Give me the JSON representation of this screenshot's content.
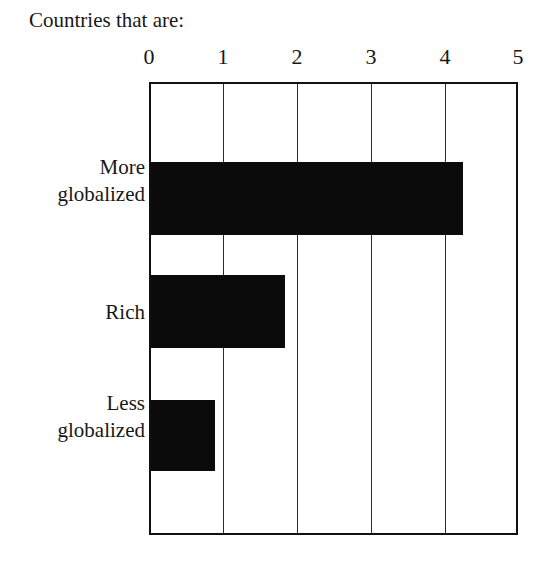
{
  "chart_data": {
    "type": "bar",
    "orientation": "horizontal",
    "title": "Countries that are:",
    "xlabel": "",
    "ylabel": "",
    "categories": [
      "More globalized",
      "Rich",
      "Less globalized"
    ],
    "category_lines": [
      [
        "More",
        "globalized"
      ],
      [
        "Rich"
      ],
      [
        "Less",
        "globalized"
      ]
    ],
    "values": [
      4.28,
      1.84,
      0.87
    ],
    "xlim": [
      0,
      5
    ],
    "xticks": [
      0,
      1,
      2,
      3,
      4,
      5
    ],
    "xtick_labels": [
      "0",
      "1",
      "2",
      "3",
      "4",
      "5"
    ],
    "grid": true,
    "grid_axis": "x",
    "legend": false,
    "bar_color": "#0b0b0b",
    "frame_color": "#111111",
    "background_color": "#ffffff",
    "axis_position": "top"
  }
}
